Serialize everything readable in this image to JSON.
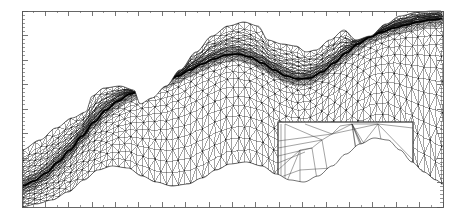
{
  "figure": {
    "kind": "anisotropic-adaptive-triangular-mesh",
    "background_color": "#ffffff",
    "line_color": "#1a1a1a",
    "frame_color": "#555555",
    "width": 460,
    "height": 222
  },
  "axes": {
    "frame": {
      "x0": 22,
      "y0": 11,
      "x1": 443,
      "y1": 207
    },
    "top": {
      "n_major": 18,
      "major_len": 5,
      "n_minor_per_major": 1,
      "minor_len": 2,
      "direction": "down"
    },
    "bottom": {
      "n_major": 18,
      "major_len": 5,
      "n_minor_per_major": 1,
      "minor_len": 2,
      "direction": "up"
    },
    "left": {
      "n_major": 8,
      "major_len": 6,
      "n_minor_per_major": 5,
      "minor_len": 3,
      "direction": "right"
    },
    "right": {
      "n_major": 8,
      "major_len": 6,
      "n_minor_per_major": 5,
      "minor_len": 3,
      "direction": "left"
    },
    "tick_labels_visible": false
  },
  "mesh": {
    "description": "unstructured triangular mesh graded toward a sinusoidal interface",
    "interface_curve": {
      "label": "refined-interface",
      "stroke_width": 1.6,
      "points": [
        [
          22,
          186
        ],
        [
          34,
          181
        ],
        [
          46,
          173
        ],
        [
          58,
          162
        ],
        [
          70,
          150
        ],
        [
          82,
          136
        ],
        [
          94,
          122
        ],
        [
          106,
          110
        ],
        [
          118,
          101
        ],
        [
          130,
          94
        ],
        [
          142,
          89
        ],
        [
          154,
          85
        ],
        [
          166,
          81
        ],
        [
          178,
          76
        ],
        [
          190,
          70
        ],
        [
          202,
          64
        ],
        [
          214,
          59
        ],
        [
          226,
          55
        ],
        [
          238,
          54
        ],
        [
          250,
          57
        ],
        [
          262,
          63
        ],
        [
          274,
          70
        ],
        [
          286,
          76
        ],
        [
          298,
          79
        ],
        [
          310,
          78
        ],
        [
          322,
          72
        ],
        [
          334,
          63
        ],
        [
          346,
          53
        ],
        [
          358,
          44
        ],
        [
          370,
          37
        ],
        [
          382,
          32
        ],
        [
          394,
          28
        ],
        [
          406,
          25
        ],
        [
          418,
          22
        ],
        [
          430,
          20
        ],
        [
          443,
          19
        ]
      ]
    },
    "band": {
      "label": "anisotropic-refined-band",
      "half_width_px": 7,
      "layers": 7
    },
    "upper_boundary": {
      "label": "mesh-top-boundary",
      "points": [
        [
          22,
          150
        ],
        [
          40,
          140
        ],
        [
          56,
          128
        ],
        [
          72,
          118
        ],
        [
          86,
          112
        ],
        [
          92,
          96
        ],
        [
          104,
          88
        ],
        [
          120,
          86
        ],
        [
          134,
          90
        ],
        [
          140,
          104
        ],
        [
          152,
          98
        ],
        [
          166,
          86
        ],
        [
          180,
          70
        ],
        [
          196,
          52
        ],
        [
          212,
          36
        ],
        [
          228,
          26
        ],
        [
          244,
          22
        ],
        [
          258,
          26
        ],
        [
          268,
          40
        ],
        [
          282,
          44
        ],
        [
          296,
          46
        ],
        [
          306,
          52
        ],
        [
          316,
          50
        ],
        [
          330,
          40
        ],
        [
          344,
          30
        ],
        [
          356,
          40
        ],
        [
          370,
          36
        ],
        [
          386,
          24
        ],
        [
          400,
          16
        ],
        [
          418,
          12
        ],
        [
          434,
          11
        ],
        [
          443,
          11
        ]
      ]
    },
    "lower_boundary": {
      "label": "mesh-bottom-boundary",
      "points": [
        [
          22,
          207
        ],
        [
          36,
          204
        ],
        [
          52,
          200
        ],
        [
          68,
          192
        ],
        [
          84,
          180
        ],
        [
          98,
          170
        ],
        [
          112,
          166
        ],
        [
          128,
          168
        ],
        [
          142,
          176
        ],
        [
          156,
          182
        ],
        [
          172,
          186
        ],
        [
          188,
          184
        ],
        [
          202,
          178
        ],
        [
          216,
          170
        ],
        [
          230,
          164
        ],
        [
          246,
          162
        ],
        [
          262,
          166
        ],
        [
          276,
          174
        ],
        [
          290,
          180
        ],
        [
          304,
          182
        ],
        [
          318,
          176
        ],
        [
          332,
          166
        ],
        [
          346,
          154
        ],
        [
          360,
          144
        ],
        [
          374,
          138
        ],
        [
          388,
          140
        ],
        [
          400,
          150
        ],
        [
          412,
          162
        ],
        [
          424,
          172
        ],
        [
          436,
          180
        ],
        [
          443,
          184
        ]
      ]
    },
    "coarse_cell_size_px": 14,
    "fine_cell_size_px": 2.2
  },
  "inset": {
    "label": "zoom-detail-box",
    "frame": {
      "x0": 278,
      "y0": 122,
      "x1": 413,
      "y1": 188
    },
    "frame_color": "#444444",
    "line_color": "#333333",
    "description": "magnified view of highly stretched anisotropic elements inside the refined band",
    "edges": [
      [
        [
          281,
          124
        ],
        [
          281,
          186
        ]
      ],
      [
        [
          285,
          124
        ],
        [
          285,
          186
        ]
      ],
      [
        [
          278,
          170
        ],
        [
          300,
          150
        ]
      ],
      [
        [
          278,
          163
        ],
        [
          305,
          152
        ]
      ],
      [
        [
          278,
          156
        ],
        [
          312,
          148
        ]
      ],
      [
        [
          278,
          148
        ],
        [
          322,
          140
        ]
      ],
      [
        [
          278,
          141
        ],
        [
          332,
          134
        ]
      ],
      [
        [
          285,
          186
        ],
        [
          300,
          150
        ]
      ],
      [
        [
          300,
          150
        ],
        [
          312,
          148
        ]
      ],
      [
        [
          312,
          148
        ],
        [
          322,
          140
        ]
      ],
      [
        [
          322,
          140
        ],
        [
          332,
          134
        ]
      ],
      [
        [
          332,
          134
        ],
        [
          340,
          126
        ]
      ],
      [
        [
          340,
          126
        ],
        [
          352,
          124
        ]
      ],
      [
        [
          285,
          124
        ],
        [
          322,
          140
        ]
      ],
      [
        [
          305,
          124
        ],
        [
          332,
          134
        ]
      ],
      [
        [
          332,
          134
        ],
        [
          352,
          124
        ]
      ],
      [
        [
          300,
          150
        ],
        [
          300,
          186
        ]
      ],
      [
        [
          312,
          148
        ],
        [
          318,
          186
        ]
      ],
      [
        [
          322,
          140
        ],
        [
          330,
          186
        ]
      ],
      [
        [
          278,
          178
        ],
        [
          300,
          170
        ]
      ],
      [
        [
          300,
          170
        ],
        [
          332,
          168
        ]
      ],
      [
        [
          332,
          168
        ],
        [
          352,
          160
        ]
      ],
      [
        [
          300,
          186
        ],
        [
          318,
          186
        ]
      ],
      [
        [
          318,
          186
        ],
        [
          330,
          186
        ]
      ],
      [
        [
          330,
          186
        ],
        [
          352,
          160
        ]
      ],
      [
        [
          352,
          124
        ],
        [
          356,
          152
        ]
      ],
      [
        [
          356,
          152
        ],
        [
          362,
          186
        ]
      ],
      [
        [
          352,
          124
        ],
        [
          362,
          186
        ]
      ],
      [
        [
          352,
          124
        ],
        [
          370,
          170
        ]
      ],
      [
        [
          352,
          124
        ],
        [
          376,
          178
        ]
      ],
      [
        [
          352,
          124
        ],
        [
          382,
          186
        ]
      ],
      [
        [
          352,
          124
        ],
        [
          390,
          186
        ]
      ],
      [
        [
          356,
          152
        ],
        [
          370,
          170
        ]
      ],
      [
        [
          370,
          170
        ],
        [
          376,
          178
        ]
      ],
      [
        [
          376,
          178
        ],
        [
          382,
          186
        ]
      ],
      [
        [
          378,
          124
        ],
        [
          390,
          186
        ]
      ],
      [
        [
          378,
          124
        ],
        [
          413,
          160
        ]
      ],
      [
        [
          390,
          186
        ],
        [
          413,
          160
        ]
      ],
      [
        [
          352,
          124
        ],
        [
          378,
          124
        ]
      ],
      [
        [
          378,
          124
        ],
        [
          413,
          128
        ]
      ],
      [
        [
          413,
          160
        ],
        [
          413,
          186
        ]
      ],
      [
        [
          390,
          186
        ],
        [
          413,
          186
        ]
      ],
      [
        [
          332,
          134
        ],
        [
          378,
          124
        ]
      ],
      [
        [
          356,
          152
        ],
        [
          378,
          124
        ]
      ]
    ]
  }
}
